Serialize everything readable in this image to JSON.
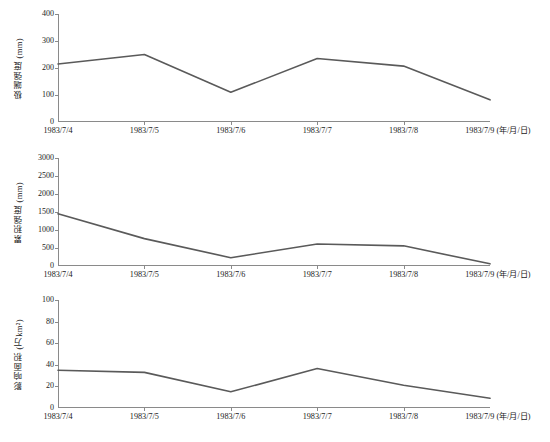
{
  "figure": {
    "width": 550,
    "height": 442,
    "line_color": "#5a5a5a",
    "axis_color": "#8a8a8a",
    "background": "#ffffff"
  },
  "x_categories": [
    "1983/7/4",
    "1983/7/5",
    "1983/7/6",
    "1983/7/7",
    "1983/7/8",
    "1983/7/9"
  ],
  "x_unit_suffix": " (年/月/日)",
  "panels": [
    {
      "id": "panel-extreme-intensity",
      "ylabel": "极端强度 (mm)",
      "yticks": [
        "0",
        "100",
        "200",
        "300",
        "400"
      ],
      "ylim": [
        0,
        400
      ],
      "values": [
        215,
        250,
        110,
        235,
        207,
        82
      ]
    },
    {
      "id": "panel-cumulative-intensity",
      "ylabel": "累积强度 (mm)",
      "yticks": [
        "0",
        "500",
        "1000",
        "1500",
        "2000",
        "2500",
        "3000"
      ],
      "ylim": [
        0,
        3000
      ],
      "values": [
        1450,
        760,
        230,
        610,
        560,
        60
      ]
    },
    {
      "id": "panel-affected-area",
      "ylabel": "影响面积 (万km²)",
      "yticks": [
        "0",
        "20",
        "40",
        "60",
        "80",
        "100"
      ],
      "ylim": [
        0,
        100
      ],
      "values": [
        35,
        33,
        15,
        36.5,
        21,
        9
      ]
    }
  ],
  "caption": "",
  "chart_data": {
    "type": "line",
    "title": "",
    "subtitle": "",
    "xlabel": "年/月/日",
    "grid": false,
    "legend": "none",
    "panel_layout": "3 stacked subplots sharing the same x axis",
    "x": [
      "1983/7/4",
      "1983/7/5",
      "1983/7/6",
      "1983/7/7",
      "1983/7/8",
      "1983/7/9"
    ],
    "series": [
      {
        "name": "极端强度 (mm)",
        "ylabel": "极端强度 (mm)",
        "ylim": [
          0,
          400
        ],
        "yticks": [
          0,
          100,
          200,
          300,
          400
        ],
        "values": [
          215,
          250,
          110,
          235,
          207,
          82
        ]
      },
      {
        "name": "累积强度 (mm)",
        "ylabel": "累积强度 (mm)",
        "ylim": [
          0,
          3000
        ],
        "yticks": [
          0,
          500,
          1000,
          1500,
          2000,
          2500,
          3000
        ],
        "values": [
          1450,
          760,
          230,
          610,
          560,
          60
        ]
      },
      {
        "name": "影响面积 (万km²)",
        "ylabel": "影响面积 (万km²)",
        "ylim": [
          0,
          100
        ],
        "yticks": [
          0,
          20,
          40,
          60,
          80,
          100
        ],
        "values": [
          35,
          33,
          15,
          36.5,
          21,
          9
        ]
      }
    ]
  }
}
